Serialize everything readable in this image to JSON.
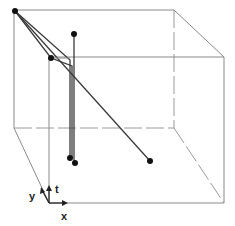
{
  "figure": {
    "type": "3d-space-time-cube",
    "axes": {
      "x_label": "x",
      "y_label": "y",
      "t_label": "t"
    },
    "cube": {
      "back_face": {
        "left": 14,
        "right": 174,
        "top": 10,
        "bottom": 128
      },
      "front_face": {
        "left": 49,
        "right": 224,
        "top": 57,
        "bottom": 203
      }
    },
    "points": [
      {
        "id": "p1",
        "x": 15,
        "y": 11
      },
      {
        "id": "p2",
        "x": 51,
        "y": 58
      },
      {
        "id": "p3",
        "x": 74,
        "y": 34
      },
      {
        "id": "p4",
        "x": 70,
        "y": 158
      },
      {
        "id": "p5",
        "x": 75,
        "y": 163
      },
      {
        "id": "p6",
        "x": 150,
        "y": 161
      }
    ],
    "colors": {
      "edge": "#8a8a8a",
      "path": "#3a3a3a",
      "point": "#111111"
    }
  }
}
